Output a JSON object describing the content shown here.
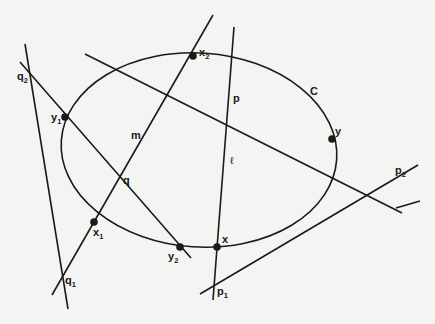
{
  "figure": {
    "curve_label": "C",
    "lines": {
      "l": "ℓ",
      "m": "m"
    },
    "points": {
      "x": {
        "base": "x",
        "sub": ""
      },
      "y": {
        "base": "y",
        "sub": ""
      },
      "x1": {
        "base": "x",
        "sub": "1"
      },
      "x2": {
        "base": "x",
        "sub": "2"
      },
      "y1": {
        "base": "y",
        "sub": "1"
      },
      "y2": {
        "base": "y",
        "sub": "2"
      },
      "p": {
        "base": "p",
        "sub": ""
      },
      "q": {
        "base": "q",
        "sub": ""
      },
      "p1": {
        "base": "p",
        "sub": "1"
      },
      "p2": {
        "base": "p",
        "sub": "2"
      },
      "q1": {
        "base": "q",
        "sub": "1"
      },
      "q2": {
        "base": "q",
        "sub": "2"
      }
    },
    "colors": {
      "ink": "#1a1a1a",
      "paper": "#f4f4f2"
    }
  }
}
